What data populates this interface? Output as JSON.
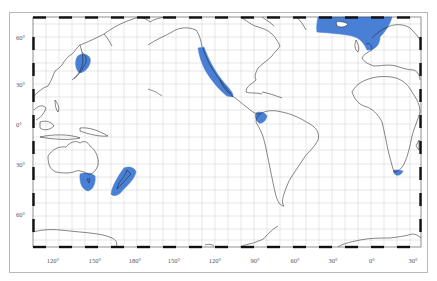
{
  "map": {
    "projection": "world equirectangular, Pacific-centered",
    "highlight_color": "#4a7fd6",
    "graticule_color": "#d4d4d4",
    "coast_color": "#1a1a1a",
    "lat_labels": [
      {
        "text": "60°",
        "y": 34
      },
      {
        "text": "30°",
        "y": 81
      },
      {
        "text": "0°",
        "y": 121
      },
      {
        "text": "30°",
        "y": 161
      },
      {
        "text": "60°",
        "y": 211
      }
    ],
    "lon_labels": [
      {
        "text": "120°",
        "x": 53
      },
      {
        "text": "150°",
        "x": 95
      },
      {
        "text": "180°",
        "x": 135
      },
      {
        "text": "150°",
        "x": 174
      },
      {
        "text": "120°",
        "x": 215
      },
      {
        "text": "90°",
        "x": 255
      },
      {
        "text": "60°",
        "x": 295
      },
      {
        "text": "30°",
        "x": 333
      },
      {
        "text": "0°",
        "x": 372
      },
      {
        "text": "30°",
        "x": 413
      }
    ],
    "highlighted_regions": [
      "Japan / Sea of Okhotsk",
      "North American Pacific coast",
      "Panama / Colombia Pacific coast",
      "North Atlantic (Iceland to North Sea)",
      "Southeast Australia / Tasmania",
      "New Zealand",
      "South Africa (Cape)"
    ]
  }
}
